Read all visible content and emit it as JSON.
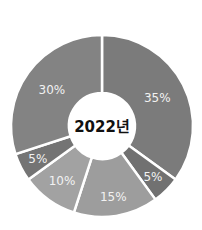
{
  "chart_data": {
    "type": "pie",
    "variant": "donut",
    "title": "",
    "center_label": "2022년",
    "start_angle_deg": 0,
    "direction": "clockwise",
    "categories": [
      "A",
      "B",
      "C",
      "D",
      "E",
      "F"
    ],
    "values": [
      35,
      5,
      15,
      10,
      5,
      30
    ],
    "labels": [
      "35%",
      "5%",
      "15%",
      "10%",
      "5%",
      "30%"
    ],
    "colors": [
      "#7b7b7b",
      "#717171",
      "#9d9d9d",
      "#a2a2a2",
      "#747474",
      "#838383"
    ],
    "legend": "none",
    "label_color": "#f2f2f2",
    "separator_color": "#ffffff"
  }
}
